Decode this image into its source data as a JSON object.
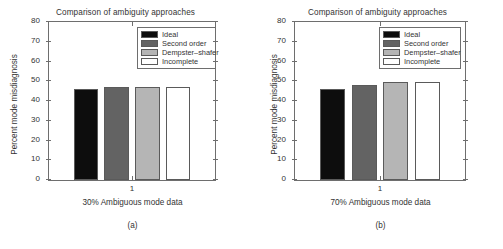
{
  "figure": {
    "width": 503,
    "height": 249
  },
  "chart_data": [
    {
      "type": "bar",
      "panel": "(a)",
      "title": "Comparison of ambiguity approaches",
      "xlabel": "30% Ambiguous mode data",
      "ylabel": "Percent mode misdiagnosis",
      "categories": [
        "1"
      ],
      "xtick_labels": [
        "1"
      ],
      "ytick_labels": [
        "0",
        "10",
        "20",
        "30",
        "40",
        "50",
        "60",
        "70",
        "80"
      ],
      "yticks": [
        0,
        10,
        20,
        30,
        40,
        50,
        60,
        70,
        80
      ],
      "ylim": [
        0,
        80
      ],
      "grid": false,
      "legend_position": "upper right",
      "series": [
        {
          "name": "Ideal",
          "values": [
            46
          ],
          "color": "#0d0d0d"
        },
        {
          "name": "Second order",
          "values": [
            47
          ],
          "color": "#636363"
        },
        {
          "name": "Dempster–shafer",
          "values": [
            47
          ],
          "color": "#b5b5b5"
        },
        {
          "name": "Incomplete",
          "values": [
            47
          ],
          "color": "#ffffff"
        }
      ]
    },
    {
      "type": "bar",
      "panel": "(b)",
      "title": "Comparison of ambiguity approaches",
      "xlabel": "70% Ambiguous mode data",
      "ylabel": "Percent mode misdiagnosis",
      "categories": [
        "1"
      ],
      "xtick_labels": [
        "1"
      ],
      "ytick_labels": [
        "0",
        "10",
        "20",
        "30",
        "40",
        "50",
        "60",
        "70",
        "80"
      ],
      "yticks": [
        0,
        10,
        20,
        30,
        40,
        50,
        60,
        70,
        80
      ],
      "ylim": [
        0,
        80
      ],
      "grid": false,
      "legend_position": "upper right",
      "series": [
        {
          "name": "Ideal",
          "values": [
            46
          ],
          "color": "#0d0d0d"
        },
        {
          "name": "Second order",
          "values": [
            48
          ],
          "color": "#636363"
        },
        {
          "name": "Dempster–shafer",
          "values": [
            49.5
          ],
          "color": "#b5b5b5"
        },
        {
          "name": "Incomplete",
          "values": [
            49.5
          ],
          "color": "#ffffff"
        }
      ]
    }
  ],
  "colors": {
    "axis": "#6e6e6e",
    "text": "#333333",
    "ideal": "#0d0d0d",
    "second_order": "#636363",
    "dempster_shafer": "#b5b5b5",
    "incomplete": "#ffffff"
  }
}
